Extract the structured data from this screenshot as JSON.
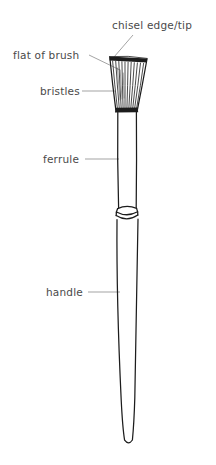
{
  "document": {
    "title": "Paintbrush anatomy diagram",
    "background_color": "#ffffff",
    "ink_color": "#1c1c1c",
    "label_color": "#4a4a4a",
    "leader_color": "#7d7d7d",
    "width": 216,
    "height": 465
  },
  "labels": [
    {
      "id": "chisel-edge-tip",
      "text": "chisel edge/tip",
      "x": 112,
      "y": 29,
      "anchor": "start"
    },
    {
      "id": "flat-of-brush",
      "text": "flat of brush",
      "x": 13,
      "y": 59,
      "anchor": "start"
    },
    {
      "id": "bristles",
      "text": "bristles",
      "x": 40,
      "y": 95,
      "anchor": "start"
    },
    {
      "id": "ferrule",
      "text": "ferrule",
      "x": 43,
      "y": 163,
      "anchor": "start"
    },
    {
      "id": "handle",
      "text": "handle",
      "x": 46,
      "y": 296,
      "anchor": "start"
    }
  ],
  "leaders": [
    {
      "id": "leader-chisel-edge-tip",
      "path": "M 133 35 L 114 57"
    },
    {
      "id": "leader-flat-of-brush",
      "path": "M 89 55 L 120 70"
    },
    {
      "id": "leader-bristles",
      "path": "M 82 91 L 115 91"
    },
    {
      "id": "leader-ferrule",
      "path": "M 85 159 L 119 159"
    },
    {
      "id": "leader-handle",
      "path": "M 88 292 L 120 292"
    }
  ],
  "brush_parts": {
    "chisel_edge": {
      "name": "chisel-edge",
      "description": "dark bristle-tip band at the very top",
      "y": 58
    },
    "bristle_head": {
      "name": "bristle-head",
      "description": "trapezoid tuft, wide at tip narrowing to ferrule",
      "top_left_x": 110,
      "top_right_x": 147,
      "bottom_left_x": 116,
      "bottom_right_x": 137,
      "top_y": 58,
      "bottom_y": 110
    },
    "bristle_strand_count": 13,
    "ferrule": {
      "name": "ferrule",
      "description": "metal sleeve, straight tube below bristles",
      "top_y": 112,
      "bottom_y": 205,
      "left_x": 118,
      "right_x": 136
    },
    "ferrule_rings": {
      "name": "ferrule-rings",
      "description": "two elliptical crimp rings where ferrule meets handle",
      "y_top": 208,
      "y_bottom": 220
    },
    "handle": {
      "name": "handle",
      "description": "long wooden shaft tapering to a rounded tip",
      "top_y": 224,
      "tip_y": 443,
      "top_left_x": 117,
      "top_right_x": 138,
      "tip_left_x": 124,
      "tip_right_x": 133
    }
  }
}
